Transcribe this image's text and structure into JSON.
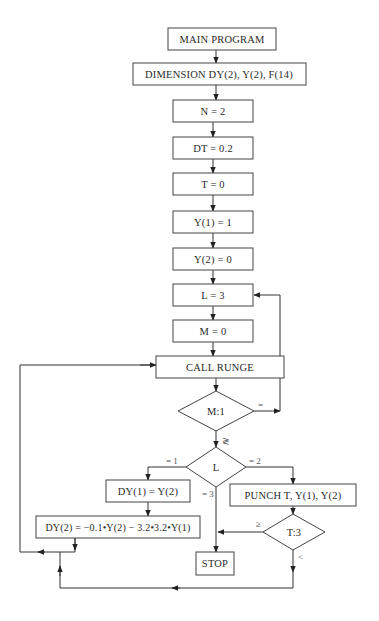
{
  "diagram": {
    "type": "flowchart",
    "nodes": {
      "main_program": "MAIN PROGRAM",
      "dimension": "DIMENSION DY(2), Y(2), F(14)",
      "n_assign": "N = 2",
      "dt_assign": "DT = 0.2",
      "t_assign": "T = 0",
      "y1_assign": "Y(1) = 1",
      "y2_assign": "Y(2) = 0",
      "l_assign": "L = 3",
      "m_assign": "M = 0",
      "call_runge": "CALL RUNGE",
      "m_decision": "M:1",
      "l_decision": "L",
      "dy1_assign": "DY(1) = Y(2)",
      "dy2_assign": "DY(2) = −0.1•Y(2) − 3.2•3.2•Y(1)",
      "punch": "PUNCH  T,  Y(1),  Y(2)",
      "t_decision": "T:3",
      "stop": "STOP"
    },
    "branch_labels": {
      "m_equal": "=",
      "m_ge": "≷",
      "l_eq1": "= 1",
      "l_eq2": "= 2",
      "l_eq3": "= 3",
      "t_ge": "≥",
      "t_lt": "<"
    },
    "colors": {
      "line": "#333333",
      "box_border": "#444444",
      "text": "#2a2a2a",
      "background": "#ffffff"
    }
  }
}
